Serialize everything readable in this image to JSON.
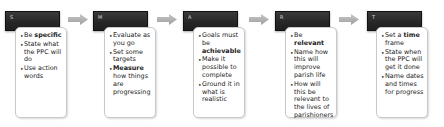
{
  "diagram": {
    "type": "process-flow",
    "colors": {
      "header_fill": "#262626",
      "header_text": "#d8d8d8",
      "card_fill": "#ffffff",
      "card_border": "#c9c9c9",
      "arrow_fill": "#b0b0b0"
    },
    "steps": [
      {
        "letter": "S",
        "bullets": [
          {
            "pre": "Be ",
            "bold": "specific",
            "post": ""
          },
          {
            "pre": "State what the PPC will do",
            "bold": "",
            "post": ""
          },
          {
            "pre": "Use action words",
            "bold": "",
            "post": ""
          }
        ]
      },
      {
        "letter": "M",
        "bullets": [
          {
            "pre": "Evaluate as you go",
            "bold": "",
            "post": ""
          },
          {
            "pre": "Set some targets",
            "bold": "",
            "post": ""
          },
          {
            "pre": "",
            "bold": "Measure",
            "post": " how things are progressing"
          }
        ]
      },
      {
        "letter": "A",
        "bullets": [
          {
            "pre": "Goals must be ",
            "bold": "achievable",
            "post": ""
          },
          {
            "pre": "Make it possible to complete",
            "bold": "",
            "post": ""
          },
          {
            "pre": "Ground it in what is realistic",
            "bold": "",
            "post": ""
          }
        ]
      },
      {
        "letter": "R",
        "bullets": [
          {
            "pre": "Be ",
            "bold": "relevant",
            "post": ""
          },
          {
            "pre": "Name how this will improve parish life",
            "bold": "",
            "post": ""
          },
          {
            "pre": "How will this be relevant to the lives of parishioners",
            "bold": "",
            "post": ""
          }
        ]
      },
      {
        "letter": "T",
        "bullets": [
          {
            "pre": "Set a ",
            "bold": "time",
            "post": " frame"
          },
          {
            "pre": "State when the PPC will get it done",
            "bold": "",
            "post": ""
          },
          {
            "pre": "Name dates and times for progress",
            "bold": "",
            "post": ""
          }
        ]
      }
    ]
  }
}
